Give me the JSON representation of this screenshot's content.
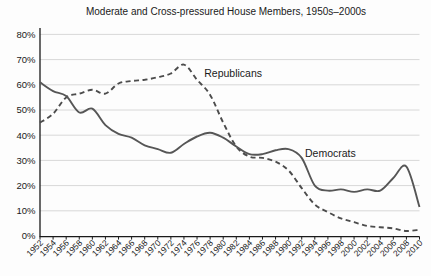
{
  "title": "Moderate and Cross-pressured House Members, 1950s–2000s",
  "chart_data": {
    "type": "line",
    "title": "Moderate and Cross-pressured House Members, 1950s–2000s",
    "xlabel": "",
    "ylabel": "",
    "ylim": [
      0,
      80
    ],
    "ytick_labels": [
      "0%",
      "10%",
      "20%",
      "30%",
      "40%",
      "50%",
      "60%",
      "70%",
      "80%"
    ],
    "grid": true,
    "legend_position": "inline-annotations",
    "x": [
      1952,
      1954,
      1956,
      1958,
      1960,
      1962,
      1964,
      1966,
      1968,
      1970,
      1972,
      1974,
      1976,
      1978,
      1980,
      1982,
      1984,
      1986,
      1988,
      1990,
      1992,
      1994,
      1996,
      1998,
      2000,
      2002,
      2004,
      2006,
      2008,
      2010
    ],
    "series": [
      {
        "name": "Republicans",
        "line_style": "dashed",
        "color": "#4c4c4c",
        "values": [
          45,
          48.5,
          55,
          56.5,
          58,
          56.5,
          60.5,
          61.5,
          62,
          63,
          64.5,
          68,
          62,
          56,
          45,
          35.5,
          31.5,
          31,
          29.5,
          26,
          19,
          12.5,
          9.5,
          7,
          5.5,
          4,
          3.5,
          3,
          2,
          2.5
        ],
        "label": {
          "text": "Republicans",
          "x": 1977.1,
          "y": 63
        }
      },
      {
        "name": "Democrats",
        "line_style": "solid",
        "color": "#565656",
        "values": [
          61,
          57.5,
          55.5,
          49,
          50.5,
          44,
          40.5,
          39,
          36,
          34.5,
          33,
          36.5,
          39.5,
          41,
          39,
          35.5,
          32.5,
          32.5,
          34,
          34.5,
          31,
          20,
          18,
          18.5,
          17.5,
          18.5,
          18,
          23,
          27.5,
          11.5
        ],
        "label": {
          "text": "Democrats",
          "x": 1992.5,
          "y": 31.3
        }
      }
    ]
  },
  "colors": {
    "gridline": "#d8d8d8",
    "axis": "#1a1a1a",
    "background": "#fdfdfd"
  }
}
